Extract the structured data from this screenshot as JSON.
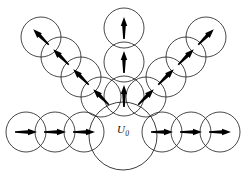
{
  "figure": {
    "background_color": "#ffffff",
    "stroke_color": "#1a1a1a",
    "arrow_color": "#000000",
    "width": 247,
    "height": 176,
    "central": {
      "label_main": "U",
      "label_sub": "0",
      "cx": 123,
      "cy": 136,
      "r": 34,
      "name": "central-domain-circle"
    },
    "groups": [
      {
        "name": "bottom-left-row",
        "arrow_direction": "right",
        "arrow_angle_deg": 0,
        "circles": [
          {
            "cx": 26,
            "cy": 132,
            "r": 20
          },
          {
            "cx": 55,
            "cy": 132,
            "r": 20
          },
          {
            "cx": 84,
            "cy": 132,
            "r": 20
          }
        ]
      },
      {
        "name": "bottom-right-row",
        "arrow_direction": "right",
        "arrow_angle_deg": 0,
        "circles": [
          {
            "cx": 162,
            "cy": 132,
            "r": 20
          },
          {
            "cx": 191,
            "cy": 132,
            "r": 20
          },
          {
            "cx": 220,
            "cy": 132,
            "r": 20
          }
        ]
      },
      {
        "name": "upper-left-branch",
        "arrow_direction": "up-left",
        "arrow_angle_deg": 135,
        "circles": [
          {
            "cx": 41,
            "cy": 37,
            "r": 20
          },
          {
            "cx": 61,
            "cy": 57,
            "r": 20
          },
          {
            "cx": 81,
            "cy": 77,
            "r": 20
          },
          {
            "cx": 101,
            "cy": 97,
            "r": 20
          }
        ]
      },
      {
        "name": "upper-right-branch",
        "arrow_direction": "up-right",
        "arrow_angle_deg": 45,
        "circles": [
          {
            "cx": 206,
            "cy": 37,
            "r": 20
          },
          {
            "cx": 186,
            "cy": 57,
            "r": 20
          },
          {
            "cx": 166,
            "cy": 77,
            "r": 20
          },
          {
            "cx": 146,
            "cy": 97,
            "r": 20
          }
        ]
      },
      {
        "name": "vertical-branch",
        "arrow_direction": "up",
        "arrow_angle_deg": 90,
        "circles": [
          {
            "cx": 124,
            "cy": 28,
            "r": 20
          },
          {
            "cx": 124,
            "cy": 62,
            "r": 20
          },
          {
            "cx": 124,
            "cy": 96,
            "r": 20
          }
        ]
      }
    ],
    "arrow": {
      "length": 22,
      "head_length": 9,
      "head_width": 6.5,
      "tail_width": 1.6
    }
  }
}
